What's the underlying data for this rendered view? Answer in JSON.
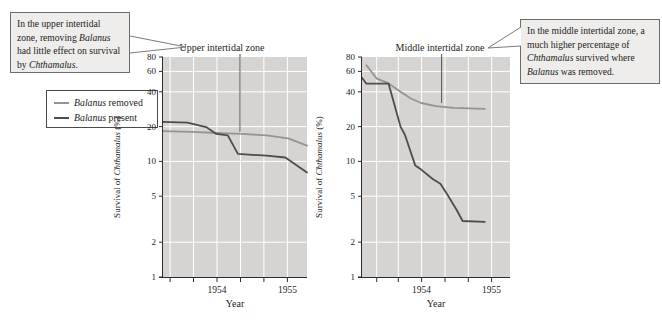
{
  "figure": {
    "callout_left": {
      "segments": [
        {
          "t": "In the upper intertidal zone, removing "
        },
        {
          "t": "Balanus",
          "i": true
        },
        {
          "t": " had little effect on survival by "
        },
        {
          "t": "Chthamalus",
          "i": true
        },
        {
          "t": "."
        }
      ]
    },
    "callout_right": {
      "segments": [
        {
          "t": "In the middle intertidal zone, a much higher percentage of "
        },
        {
          "t": "Chthamalus",
          "i": true
        },
        {
          "t": " survived where "
        },
        {
          "t": "Balanus",
          "i": true
        },
        {
          "t": " was removed."
        }
      ]
    },
    "legend": {
      "items": [
        {
          "segments": [
            {
              "t": "Balanus",
              "i": true
            },
            {
              "t": " removed"
            }
          ],
          "color": "#98948c"
        },
        {
          "segments": [
            {
              "t": "Balanus",
              "i": true
            },
            {
              "t": " present"
            }
          ],
          "color": "#4e4d4b"
        }
      ]
    },
    "colors": {
      "plot_bg": "#d5d4d2",
      "grid": "#ffffff",
      "axis": "#2e2d2b",
      "text": "#1d1c1a",
      "removed": "#98948c",
      "present": "#4e4d4b",
      "callout_bg": "#eeedeb",
      "callout_border": "#6b6b6b",
      "pointer": "#555550"
    }
  },
  "chart_data": [
    {
      "type": "line",
      "title": "Upper intertidal zone",
      "ylabel_segments": [
        {
          "t": "Survival of "
        },
        {
          "t": "Chthamalus",
          "i": true
        },
        {
          "t": " (%)"
        }
      ],
      "xlabel": "Year",
      "yscale": "log",
      "ylim": [
        1,
        80
      ],
      "yticks": [
        80,
        60,
        40,
        20,
        10,
        5,
        2,
        1
      ],
      "grid_yticks": [
        60,
        40,
        20,
        10,
        5,
        2
      ],
      "xticks": [
        {
          "frac": 0.049,
          "label": ""
        },
        {
          "frac": 0.212,
          "label": ""
        },
        {
          "frac": 0.375,
          "label": "1954"
        },
        {
          "frac": 0.538,
          "label": ""
        },
        {
          "frac": 0.701,
          "label": ""
        },
        {
          "frac": 0.864,
          "label": "1955"
        }
      ],
      "series": [
        {
          "name": "Balanus removed",
          "color_key": "removed",
          "points": [
            [
              0.0,
              18.3
            ],
            [
              0.2,
              18.0
            ],
            [
              0.37,
              17.6
            ],
            [
              0.55,
              17.3
            ],
            [
              0.72,
              16.8
            ],
            [
              0.87,
              15.8
            ],
            [
              1.0,
              13.7
            ]
          ]
        },
        {
          "name": "Balanus present",
          "color_key": "present",
          "points": [
            [
              0.0,
              22.0
            ],
            [
              0.17,
              21.6
            ],
            [
              0.3,
              19.8
            ],
            [
              0.37,
              17.3
            ],
            [
              0.45,
              16.8
            ],
            [
              0.52,
              11.6
            ],
            [
              0.72,
              11.2
            ],
            [
              0.85,
              10.8
            ],
            [
              1.0,
              8.0
            ]
          ]
        }
      ],
      "annotation": {
        "title_frac": 0.41,
        "pointer_frac": 0.535,
        "pointer_end_value": 18
      }
    },
    {
      "type": "line",
      "title": "Middle intertidal zone",
      "ylabel_segments": [
        {
          "t": "Survival of "
        },
        {
          "t": "Chthamalus",
          "i": true
        },
        {
          "t": " (%)"
        }
      ],
      "xlabel": "Year",
      "yscale": "log",
      "ylim": [
        1,
        80
      ],
      "yticks": [
        80,
        60,
        40,
        20,
        10,
        5,
        2,
        1
      ],
      "grid_yticks": [
        60,
        40,
        20,
        10,
        5,
        2
      ],
      "xticks": [
        {
          "frac": 0.099,
          "label": ""
        },
        {
          "frac": 0.245,
          "label": ""
        },
        {
          "frac": 0.403,
          "label": "1954"
        },
        {
          "frac": 0.561,
          "label": ""
        },
        {
          "frac": 0.718,
          "label": ""
        },
        {
          "frac": 0.876,
          "label": "1955"
        }
      ],
      "series": [
        {
          "name": "Balanus removed",
          "color_key": "removed",
          "points": [
            [
              0.03,
              68
            ],
            [
              0.1,
              52
            ],
            [
              0.17,
              48
            ],
            [
              0.26,
              40
            ],
            [
              0.33,
              35
            ],
            [
              0.4,
              32
            ],
            [
              0.5,
              30
            ],
            [
              0.62,
              29
            ],
            [
              0.83,
              28.5
            ]
          ]
        },
        {
          "name": "Balanus present",
          "color_key": "present",
          "points": [
            [
              0.0,
              53
            ],
            [
              0.03,
              47
            ],
            [
              0.18,
              47
            ],
            [
              0.26,
              20
            ],
            [
              0.29,
              17
            ],
            [
              0.36,
              9.2
            ],
            [
              0.4,
              8.5
            ],
            [
              0.48,
              7.0
            ],
            [
              0.53,
              6.4
            ],
            [
              0.58,
              5.1
            ],
            [
              0.64,
              3.8
            ],
            [
              0.68,
              3.05
            ],
            [
              0.83,
              3.0
            ]
          ]
        }
      ],
      "annotation": {
        "title_frac": 0.527,
        "pointer_frac": 0.538,
        "pointer_end_value": 32
      }
    }
  ]
}
